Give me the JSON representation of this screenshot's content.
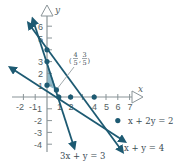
{
  "diagram": {
    "type": "linear-programming-feasible-region",
    "axes": {
      "x_label": "x",
      "y_label": "y",
      "x_ticks": [
        "-2",
        "-1",
        "1",
        "2",
        "4",
        "5",
        "6",
        "7"
      ],
      "y_ticks": [
        "6",
        "5",
        "3",
        "2",
        "1",
        "-1",
        "-2",
        "-3",
        "-4"
      ]
    },
    "lines": [
      {
        "equation": "x + 2y = 2"
      },
      {
        "equation": "x + y = 4"
      },
      {
        "equation": "3x + y = 3"
      }
    ],
    "point_label": {
      "num_x": "4",
      "den_x": "5",
      "num_y": "3",
      "den_y": "5"
    },
    "colors": {
      "line": "#1d5a72",
      "dot": "#1d5a72",
      "shade": "#8fb9c9",
      "axis": "#8a9498"
    }
  }
}
